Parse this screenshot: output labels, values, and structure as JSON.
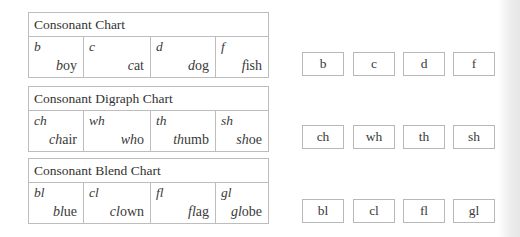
{
  "charts": [
    {
      "title": "Consonant Chart",
      "cells": [
        {
          "sound": "b",
          "word_prefix": "b",
          "word_rest": "oy"
        },
        {
          "sound": "c",
          "word_prefix": "c",
          "word_rest": "at"
        },
        {
          "sound": "d",
          "word_prefix": "d",
          "word_rest": "og"
        },
        {
          "sound": "f",
          "word_prefix": "f",
          "word_rest": "ish"
        }
      ]
    },
    {
      "title": "Consonant Digraph Chart",
      "cells": [
        {
          "sound": "ch",
          "word_prefix": "ch",
          "word_rest": "air"
        },
        {
          "sound": "wh",
          "word_prefix": "wh",
          "word_rest": "o"
        },
        {
          "sound": "th",
          "word_prefix": "th",
          "word_rest": "umb"
        },
        {
          "sound": "sh",
          "word_prefix": "sh",
          "word_rest": "oe"
        }
      ]
    },
    {
      "title": "Consonant Blend Chart",
      "cells": [
        {
          "sound": "bl",
          "word_prefix": "bl",
          "word_rest": "ue"
        },
        {
          "sound": "cl",
          "word_prefix": "cl",
          "word_rest": "own"
        },
        {
          "sound": "fl",
          "word_prefix": "fl",
          "word_rest": "ag"
        },
        {
          "sound": "gl",
          "word_prefix": "gl",
          "word_rest": "obe"
        }
      ]
    }
  ],
  "answer_boxes": [
    [
      "b",
      "c",
      "d",
      "f"
    ],
    [
      "ch",
      "wh",
      "th",
      "sh"
    ],
    [
      "bl",
      "cl",
      "fl",
      "gl"
    ]
  ]
}
